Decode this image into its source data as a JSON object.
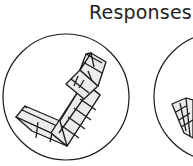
{
  "header": {
    "title": "Responses"
  },
  "colors": {
    "stroke": "#1a1a1a",
    "fill_light": "#ececec",
    "background": "#ffffff"
  },
  "responses": [
    {
      "id": 1,
      "shape": "L-shaped cube tower (rotated), long arm up-right, short arm left"
    },
    {
      "id": 2,
      "shape": "partially visible cube figure, cropped at right edge"
    }
  ]
}
